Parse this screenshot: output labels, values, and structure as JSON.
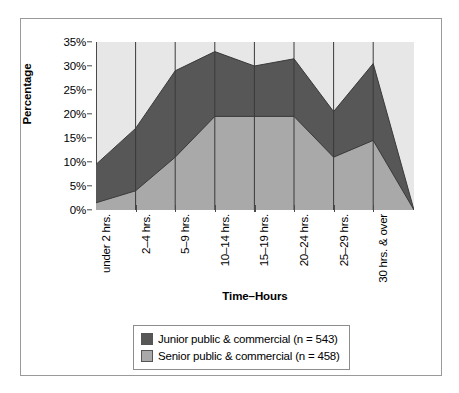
{
  "chart_data": {
    "type": "area",
    "title": "",
    "xlabel": "Time–Hours",
    "ylabel": "Percentage",
    "categories": [
      "under 2 hrs.",
      "2–4 hrs.",
      "5–9 hrs.",
      "10–14 hrs.",
      "15–19 hrs.",
      "20–24 hrs.",
      "25–29 hrs.",
      "30 hrs. & over"
    ],
    "series": [
      {
        "name": "Junior public & commercial (n = 543)",
        "color": "#575757",
        "values": [
          9.5,
          17,
          29,
          33,
          30,
          31.5,
          20.5,
          30.5
        ]
      },
      {
        "name": "Senior public & commercial (n = 458)",
        "color": "#a9a9a9",
        "values": [
          1.5,
          4,
          11,
          19.5,
          19.5,
          19.5,
          11,
          14.5
        ]
      }
    ],
    "ylim": [
      0,
      35
    ],
    "yticks": [
      "0%",
      "5%",
      "10%",
      "15%",
      "20%",
      "25%",
      "30%",
      "35%"
    ],
    "ytick_values": [
      0,
      5,
      10,
      15,
      20,
      25,
      30,
      35
    ],
    "grid": "vertical-category-lines",
    "legend_position": "bottom",
    "plot_background": "#e7e7e7"
  },
  "legend": {
    "items": [
      {
        "label": "Junior public & commercial (n = 543)",
        "color": "#575757"
      },
      {
        "label": "Senior public & commercial (n = 458)",
        "color": "#a9a9a9"
      }
    ]
  }
}
